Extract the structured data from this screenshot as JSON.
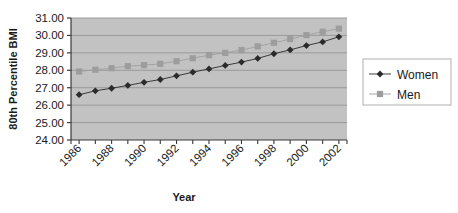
{
  "chart_data": {
    "type": "line",
    "title": "",
    "xlabel": "Year",
    "ylabel": "80th Percentile BMI",
    "x": [
      1986,
      1987,
      1988,
      1989,
      1990,
      1991,
      1992,
      1993,
      1994,
      1995,
      1996,
      1997,
      1998,
      1999,
      2000,
      2001,
      2002
    ],
    "xtick_labels": [
      "1986",
      "1988",
      "1990",
      "1992",
      "1994",
      "1996",
      "1998",
      "2000",
      "2002"
    ],
    "xtick_values": [
      1986,
      1988,
      1990,
      1992,
      1994,
      1996,
      1998,
      2000,
      2002
    ],
    "ytick_labels": [
      "24.00",
      "25.00",
      "26.00",
      "27.00",
      "28.00",
      "29.00",
      "30.00",
      "31.00"
    ],
    "ytick_values": [
      24,
      25,
      26,
      27,
      28,
      29,
      30,
      31
    ],
    "ylim": [
      24,
      31
    ],
    "xlim": [
      1985.5,
      2002.5
    ],
    "grid": "horizontal",
    "legend_position": "right",
    "plot_background": "#c2c2c2",
    "gridline_color": "#9a9a9a",
    "series": [
      {
        "name": "Women",
        "marker": "diamond",
        "color": "#2b2b2b",
        "values": [
          26.6,
          26.82,
          26.97,
          27.13,
          27.31,
          27.47,
          27.68,
          27.89,
          28.08,
          28.28,
          28.47,
          28.68,
          28.95,
          29.17,
          29.42,
          29.63,
          29.92
        ]
      },
      {
        "name": "Men",
        "marker": "square",
        "color": "#9d9d9d",
        "values": [
          27.93,
          28.03,
          28.12,
          28.24,
          28.29,
          28.37,
          28.52,
          28.69,
          28.87,
          29.0,
          29.16,
          29.37,
          29.58,
          29.79,
          30.02,
          30.21,
          30.39
        ]
      }
    ]
  },
  "legend": {
    "items": [
      {
        "label": "Women"
      },
      {
        "label": "Men"
      }
    ]
  },
  "axes": {
    "x_title": "Year",
    "y_title": "80th Percentile BMI"
  }
}
